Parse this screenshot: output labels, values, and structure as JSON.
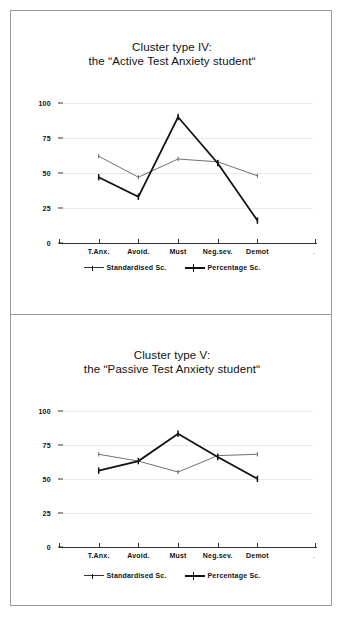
{
  "figure": {
    "frame_color": "#9a9a9a",
    "background": "#ffffff"
  },
  "legend": {
    "series_1_label": "Standardised Sc.",
    "series_2_label": "Percentage Sc."
  },
  "axis": {
    "y_ticks": [
      "0",
      "25",
      "50",
      "75",
      "100"
    ],
    "x_labels": [
      "T.Anx.",
      "Avoid.",
      "Must",
      "Neg.sev.",
      "Demot"
    ]
  },
  "chart_data": [
    {
      "type": "line",
      "title": "Cluster type IV:",
      "subtitle": "the ʺActive Test Anxiety studentʺ",
      "categories": [
        "T.Anx.",
        "Avoid.",
        "Must",
        "Neg.sev.",
        "Demot"
      ],
      "series": [
        {
          "name": "Standardised Sc.",
          "values": [
            62,
            47,
            60,
            58,
            48
          ],
          "style": "thin",
          "color": "#333333"
        },
        {
          "name": "Percentage Sc.",
          "values": [
            47,
            33,
            90,
            57,
            16
          ],
          "style": "thick",
          "color": "#111111"
        }
      ],
      "xlabel": "",
      "ylabel": "",
      "ylim": [
        0,
        110
      ],
      "yticks": [
        0,
        25,
        50,
        75,
        100
      ],
      "grid": true,
      "legend_position": "bottom"
    },
    {
      "type": "line",
      "title": "Cluster type V:",
      "subtitle": "the ʺPassive Test Anxiety studentʺ",
      "categories": [
        "T.Anx.",
        "Avoid.",
        "Must",
        "Neg.sev.",
        "Demot"
      ],
      "series": [
        {
          "name": "Standardised Sc.",
          "values": [
            68,
            63,
            55,
            67,
            68
          ],
          "style": "thin",
          "color": "#333333"
        },
        {
          "name": "Percentage Sc.",
          "values": [
            56,
            63,
            83,
            66,
            50
          ],
          "style": "thick",
          "color": "#111111"
        }
      ],
      "xlabel": "",
      "ylabel": "",
      "ylim": [
        0,
        110
      ],
      "yticks": [
        0,
        25,
        50,
        75,
        100
      ],
      "grid": true,
      "legend_position": "bottom"
    }
  ]
}
